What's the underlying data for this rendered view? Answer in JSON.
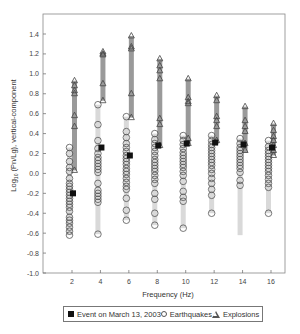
{
  "chart_data": {
    "type": "scatter",
    "title": "",
    "xlabel": "Frequency (Hz)",
    "ylabel": "Log10 (Pn/Lg), vertical-component",
    "ylabel_parts": {
      "prefix": "Log",
      "sub": "10",
      "rest": " (Pn/Lg), vertical-component"
    },
    "xlim": [
      0,
      17
    ],
    "ylim": [
      -1.0,
      1.5
    ],
    "x_ticks": [
      2,
      4,
      6,
      8,
      10,
      12,
      14,
      16
    ],
    "y_ticks": [
      -1.0,
      -0.8,
      -0.6,
      -0.4,
      -0.2,
      0.0,
      0.2,
      0.4,
      0.6,
      0.8,
      1.0,
      1.2,
      1.4
    ],
    "y_tick_labels": [
      "-1.0",
      "-0.8",
      "-0.6",
      "-0.4",
      "-0.2",
      "0.0",
      "0.2",
      "0.4",
      "0.6",
      "0.8",
      "1.0",
      "1.2",
      "1.4"
    ],
    "grid": false,
    "legend_position": "bottom",
    "colors": {
      "earthquake_bar": "#d9d9d9",
      "explosion_bar": "#9a9a9a",
      "marker_stroke": "#555555",
      "event_marker": "#111111"
    },
    "series": [
      {
        "name": "Earthquakes",
        "marker": "circle",
        "groups": [
          {
            "freq": 2,
            "range": [
              -0.62,
              0.26
            ],
            "values": [
              0.26,
              0.2,
              0.12,
              0.06,
              0.02,
              -0.05,
              -0.1,
              -0.13,
              -0.16,
              -0.19,
              -0.22,
              -0.25,
              -0.28,
              -0.31,
              -0.34,
              -0.38,
              -0.44,
              -0.47,
              -0.5,
              -0.54,
              -0.58,
              -0.62
            ]
          },
          {
            "freq": 4,
            "range": [
              -0.61,
              0.69
            ],
            "values": [
              0.69,
              0.49,
              0.33,
              0.25,
              0.2,
              0.16,
              0.13,
              0.1,
              0.07,
              0.04,
              0.01,
              -0.1,
              -0.17,
              -0.2,
              -0.23,
              -0.26,
              -0.29,
              -0.61
            ]
          },
          {
            "freq": 6,
            "range": [
              -0.47,
              0.57
            ],
            "values": [
              0.57,
              0.42,
              0.36,
              0.3,
              0.26,
              0.22,
              0.18,
              0.15,
              0.12,
              0.09,
              0.05,
              0.02,
              -0.01,
              -0.05,
              -0.09,
              -0.13,
              -0.16,
              -0.25,
              -0.37,
              -0.47
            ]
          },
          {
            "freq": 8,
            "range": [
              -0.52,
              0.4
            ],
            "values": [
              0.4,
              0.34,
              0.3,
              0.26,
              0.22,
              0.18,
              0.14,
              0.11,
              0.08,
              0.05,
              0.02,
              -0.02,
              -0.06,
              -0.1,
              -0.2,
              -0.26,
              -0.4,
              -0.52
            ]
          },
          {
            "freq": 10,
            "range": [
              -0.55,
              0.38
            ],
            "values": [
              0.38,
              0.33,
              0.29,
              0.25,
              0.21,
              0.18,
              0.15,
              0.12,
              0.09,
              0.06,
              0.02,
              -0.02,
              -0.08,
              -0.18,
              -0.24,
              -0.28,
              -0.55
            ]
          },
          {
            "freq": 12,
            "range": [
              -0.4,
              0.38
            ],
            "values": [
              0.38,
              0.33,
              0.29,
              0.26,
              0.23,
              0.2,
              0.17,
              0.14,
              0.11,
              0.08,
              0.04,
              0.0,
              -0.05,
              -0.1,
              -0.16,
              -0.22,
              -0.4
            ]
          },
          {
            "freq": 14,
            "range": [
              -0.12,
              0.35
            ],
            "bar_range": [
              -0.62,
              0.35
            ],
            "values": [
              0.35,
              0.3,
              0.26,
              0.23,
              0.2,
              0.17,
              0.14,
              0.11,
              0.08,
              0.05,
              0.01,
              -0.07,
              -0.12
            ]
          },
          {
            "freq": 16,
            "range": [
              -0.4,
              0.33
            ],
            "values": [
              0.33,
              0.27,
              0.23,
              0.2,
              0.17,
              0.14,
              0.11,
              0.08,
              0.05,
              0.02,
              -0.02,
              -0.06,
              -0.1,
              -0.14,
              -0.4
            ]
          }
        ]
      },
      {
        "name": "Explosions",
        "marker": "triangle",
        "groups": [
          {
            "freq": 2,
            "range": [
              0.03,
              0.93
            ],
            "values": [
              0.93,
              0.88,
              0.83,
              0.8,
              0.58,
              0.47,
              0.03
            ]
          },
          {
            "freq": 4,
            "range": [
              0.73,
              1.22
            ],
            "values": [
              1.22,
              1.2,
              1.19,
              0.9,
              0.73
            ]
          },
          {
            "freq": 6,
            "range": [
              0.56,
              1.38
            ],
            "values": [
              1.38,
              1.27,
              1.25,
              0.8,
              0.56
            ]
          },
          {
            "freq": 8,
            "range": [
              0.28,
              1.15
            ],
            "values": [
              1.15,
              1.08,
              1.03,
              0.95,
              0.55,
              0.49,
              0.28
            ]
          },
          {
            "freq": 10,
            "range": [
              0.3,
              0.95
            ],
            "values": [
              0.95,
              0.76,
              0.72,
              0.7,
              0.35,
              0.3
            ]
          },
          {
            "freq": 12,
            "range": [
              0.3,
              0.78
            ],
            "values": [
              0.78,
              0.73,
              0.57,
              0.53,
              0.47,
              0.33
            ]
          },
          {
            "freq": 14,
            "range": [
              0.21,
              0.67
            ],
            "values": [
              0.67,
              0.53,
              0.47,
              0.42,
              0.3,
              0.23
            ]
          },
          {
            "freq": 16,
            "range": [
              0.18,
              0.5
            ],
            "values": [
              0.5,
              0.43,
              0.37,
              0.33,
              0.28,
              0.23,
              0.18
            ]
          }
        ]
      },
      {
        "name": "Event on March 13, 2003",
        "marker": "square",
        "points": [
          {
            "freq": 2,
            "value": -0.2
          },
          {
            "freq": 4,
            "value": 0.26
          },
          {
            "freq": 6,
            "value": 0.18
          },
          {
            "freq": 8,
            "value": 0.28
          },
          {
            "freq": 10,
            "value": 0.3
          },
          {
            "freq": 12,
            "value": 0.31
          },
          {
            "freq": 14,
            "value": 0.29
          },
          {
            "freq": 16,
            "value": 0.26
          }
        ]
      }
    ]
  },
  "legend": {
    "items": [
      {
        "label": "Event on March 13, 2003",
        "symbol": "filled-square"
      },
      {
        "label": "Earthquakes",
        "symbol": "open-circle"
      },
      {
        "label": "Explosions",
        "symbol": "open-triangle"
      }
    ]
  }
}
